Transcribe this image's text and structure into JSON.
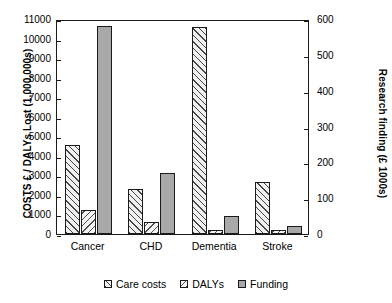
{
  "chart_data": {
    "type": "bar",
    "title": "",
    "categories": [
      "Cancer",
      "CHD",
      "Dementia",
      "Stroke"
    ],
    "series": [
      {
        "name": "Care costs",
        "axis": "left",
        "values": [
          4550,
          2320,
          10600,
          2650
        ]
      },
      {
        "name": "DALYs",
        "axis": "left",
        "values": [
          1230,
          620,
          220,
          230
        ]
      },
      {
        "name": "Funding",
        "axis": "right",
        "values": [
          580,
          170,
          50,
          22
        ]
      }
    ],
    "left_axis": {
      "label": "COSTS £ / DALYs Lost (1,000,000s)",
      "ticks": [
        0,
        1000,
        2000,
        3000,
        4000,
        5000,
        6000,
        7000,
        8000,
        9000,
        10000,
        11000
      ],
      "ylim": [
        0,
        11000
      ]
    },
    "right_axis": {
      "label": "Research finding (£ 1000s)",
      "ticks": [
        0,
        100,
        200,
        300,
        400,
        500,
        600
      ],
      "ylim": [
        0,
        600
      ]
    },
    "xlabel": "",
    "grid": false,
    "legend_position": "bottom",
    "legend": [
      "Care costs",
      "DALYs",
      "Funding"
    ]
  },
  "legend": {
    "items": [
      {
        "label": "Care costs",
        "pattern": "diagonal-hatch-up",
        "color": "#f0f0f0"
      },
      {
        "label": "DALYs",
        "pattern": "diagonal-hatch-down",
        "color": "#f4f4f4"
      },
      {
        "label": "Funding",
        "pattern": "solid",
        "color": "#a8a8a8"
      }
    ]
  },
  "colors": {
    "axis": "#1a1a1a",
    "care_costs": "#f0f0f0",
    "dalys": "#f4f4f4",
    "funding": "#a8a8a8",
    "background": "#ffffff"
  }
}
